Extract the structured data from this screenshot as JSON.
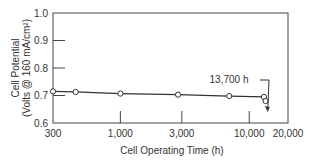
{
  "chart_data": {
    "type": "line",
    "title": "",
    "xlabel": "Cell Operating Time (h)",
    "ylabel_line1": "Cell Potential",
    "ylabel_line2": "(Volts @ 160 mA/cm²)",
    "x_scale": "log",
    "xlim": [
      300,
      20000
    ],
    "ylim": [
      0.6,
      1.0
    ],
    "x_ticks": [
      {
        "value": 300,
        "label": "300"
      },
      {
        "value": 1000,
        "label": "1,000"
      },
      {
        "value": 3000,
        "label": "3,000"
      },
      {
        "value": 10000,
        "label": "10,000"
      },
      {
        "value": 20000,
        "label": "20,000"
      }
    ],
    "y_ticks": [
      {
        "value": 0.6,
        "label": "0.6"
      },
      {
        "value": 0.7,
        "label": "0.7"
      },
      {
        "value": 0.8,
        "label": "0.8"
      },
      {
        "value": 0.9,
        "label": "0.9"
      },
      {
        "value": 1.0,
        "label": "1.0"
      }
    ],
    "grid": false,
    "series": [
      {
        "name": "Cell Potential",
        "x": [
          300,
          450,
          1000,
          2800,
          7000,
          13000,
          13400,
          13700
        ],
        "y": [
          0.715,
          0.713,
          0.707,
          0.703,
          0.698,
          0.695,
          0.68,
          0.665
        ]
      }
    ],
    "annotations": [
      {
        "text": "13,700 h",
        "x": 13700,
        "y": 0.64
      }
    ]
  }
}
